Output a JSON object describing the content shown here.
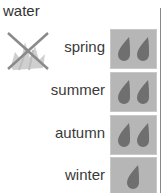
{
  "title": "water",
  "crossed_icon": "plant-crossed-out-icon",
  "colors": {
    "box": "#b6b6b6",
    "drop": "#6f6f6f",
    "text": "#333333"
  },
  "seasons": [
    {
      "label": "spring",
      "drops": 2
    },
    {
      "label": "summer",
      "drops": 2
    },
    {
      "label": "autumn",
      "drops": 2
    },
    {
      "label": "winter",
      "drops": 1
    }
  ]
}
